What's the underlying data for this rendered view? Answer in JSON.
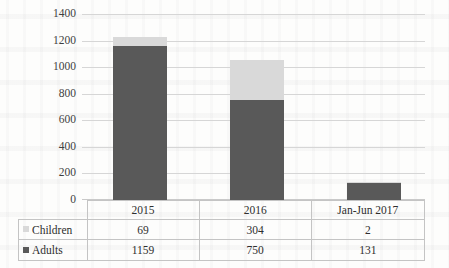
{
  "chart_data": {
    "type": "bar",
    "subtype": "stacked-column",
    "title": "",
    "xlabel": "",
    "ylabel": "",
    "categories": [
      "2015",
      "2016",
      "Jan-Jun 2017"
    ],
    "series": [
      {
        "name": "Children",
        "color": "#D9D9D9",
        "values": [
          69,
          304,
          2
        ]
      },
      {
        "name": "Adults",
        "color": "#595959",
        "values": [
          1159,
          750,
          131
        ]
      }
    ],
    "stack_order_bottom_to_top": [
      "Adults",
      "Children"
    ],
    "ylim": [
      0,
      1400
    ],
    "ytick_step": 200,
    "yticks": [
      "1400",
      "1200",
      "1000",
      "800",
      "600",
      "400",
      "200",
      "0"
    ],
    "grid": true,
    "legend_position": "data-table-row-headers",
    "data_table_visible": true
  },
  "table": {
    "corner_label": "",
    "column_headers": [
      "2015",
      "2016",
      "Jan-Jun 2017"
    ],
    "rows": [
      {
        "label": "Children",
        "swatch": "children-swatch",
        "values": [
          "69",
          "304",
          "2"
        ]
      },
      {
        "label": "Adults",
        "swatch": "adults-swatch",
        "values": [
          "1159",
          "750",
          "131"
        ]
      }
    ]
  },
  "colors": {
    "children": "#D9D9D9",
    "adults": "#595959",
    "gridline": "#D6D6D6",
    "table_border": "#C4C4C4",
    "text": "#2E2E2E"
  }
}
